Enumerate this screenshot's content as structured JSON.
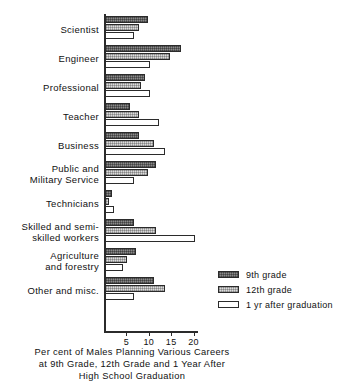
{
  "chart_data": {
    "type": "bar",
    "orientation": "horizontal",
    "title": "",
    "caption_lines": [
      "Per cent of  Males Planning Various Careers",
      "at  9th Grade, 12th Grade and 1 Year After",
      "High School  Graduation"
    ],
    "xlabel": "",
    "ylabel": "",
    "xlim": [
      0,
      21
    ],
    "grid": false,
    "legend_position": "right-lower",
    "tick_values": [
      5,
      10,
      15,
      20
    ],
    "tick_labels": [
      "5",
      "10",
      "15",
      "20"
    ],
    "categories": [
      "Scientist",
      "Engineer",
      "Professional",
      "Teacher",
      "Business",
      "Public and\nMilitary Service",
      "Technicians",
      "Skilled and  semi-\nskilled workers",
      "Agriculture\nand forestry",
      "Other and  misc."
    ],
    "series": [
      {
        "name": "9th grade",
        "color": "#8a8a8a",
        "values": [
          9.5,
          17.0,
          9.0,
          5.5,
          7.5,
          11.5,
          1.5,
          6.5,
          7.0,
          11.0
        ]
      },
      {
        "name": "12th grade",
        "color": "#dcdcdc",
        "values": [
          7.5,
          14.5,
          8.0,
          7.5,
          11.0,
          9.5,
          1.0,
          11.5,
          5.0,
          13.5
        ]
      },
      {
        "name": "1 yr after graduation",
        "color": "#ffffff",
        "values": [
          6.5,
          10.0,
          10.0,
          12.0,
          13.5,
          6.5,
          2.0,
          20.0,
          4.0,
          6.5
        ]
      }
    ]
  },
  "legend": {
    "items": [
      {
        "label": "9th grade"
      },
      {
        "label": "12th grade"
      },
      {
        "label": "1 yr after graduation"
      }
    ]
  },
  "page": {
    "top_bleed": ""
  }
}
